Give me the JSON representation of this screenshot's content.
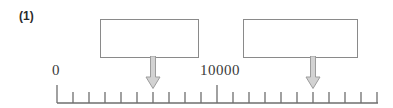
{
  "figure": {
    "item_label": "(1)",
    "type": "number-line-diagram",
    "line_color": "#6e6e6e",
    "box_border_color": "#8a8a8a",
    "arrow_fill_color": "#d0d0d0",
    "arrow_stroke_color": "#9a9a9a",
    "text_color": "#3a3a3a"
  },
  "boxes": [
    {
      "id": "box-left",
      "value": ""
    },
    {
      "id": "box-right",
      "value": ""
    }
  ],
  "number_line": {
    "labels": [
      {
        "id": "label-zero",
        "text": "0",
        "tick_index": 0
      },
      {
        "id": "label-ten-k",
        "text": "10000",
        "tick_index": 10
      }
    ],
    "tick_count": 21,
    "major_tick_indices": [
      0,
      10
    ],
    "start_x": 57,
    "end_x": 378,
    "tick_spacing": 16,
    "baseline_y": 103
  },
  "arrows": [
    {
      "id": "arrow-left",
      "points_to_tick_index": 6,
      "tick_x": 153
    },
    {
      "id": "arrow-right",
      "points_to_tick_index": 16,
      "tick_x": 313
    }
  ]
}
